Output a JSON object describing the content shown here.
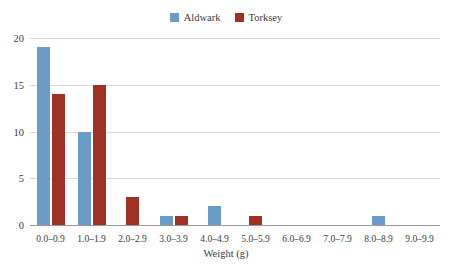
{
  "chart_data": {
    "type": "bar",
    "title": "",
    "xlabel": "Weight (g)",
    "ylabel": "",
    "categories": [
      "0.0–0.9",
      "1.0–1.9",
      "2.0–2.9",
      "3.0–3.9",
      "4.0–4.9",
      "5.0–5.9",
      "6.0–6.9",
      "7.0–7.9",
      "8.0–8.9",
      "9.0–9.9"
    ],
    "series": [
      {
        "name": "Aldwark",
        "color": "#6A9BC9",
        "values": [
          19,
          10,
          0,
          1,
          2,
          0,
          0,
          0,
          1,
          0
        ]
      },
      {
        "name": "Torksey",
        "color": "#9E3124",
        "values": [
          14,
          15,
          3,
          1,
          0,
          1,
          0,
          0,
          0,
          0
        ]
      }
    ],
    "ylim": [
      0,
      20
    ],
    "yticks": [
      0,
      5,
      10,
      15,
      20
    ],
    "ytick_labels": [
      "0",
      "5",
      "10",
      "15",
      "20"
    ],
    "grid": true,
    "legend_position": "top-center"
  },
  "legend": {
    "items": [
      {
        "label": "Aldwark",
        "color": "#6A9BC9"
      },
      {
        "label": "Torksey",
        "color": "#9E3124"
      }
    ]
  },
  "axes": {
    "x_title": "Weight (g)"
  }
}
